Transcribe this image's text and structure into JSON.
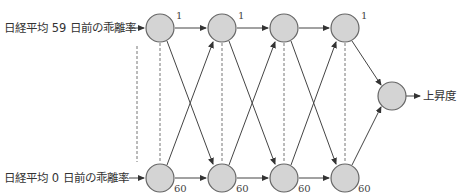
{
  "inputs": {
    "top": "日経平均 59 日前の乖離率",
    "bottom": "日経平均 0 日前の乖離率"
  },
  "output": {
    "label": "上昇度"
  },
  "layer_labels": {
    "top": [
      "1",
      "1",
      "1"
    ],
    "bottom": [
      "60",
      "60",
      "60",
      "60"
    ]
  },
  "colors": {
    "node_fill": "#d4d4d4",
    "node_stroke": "#666666",
    "line": "#444444"
  }
}
